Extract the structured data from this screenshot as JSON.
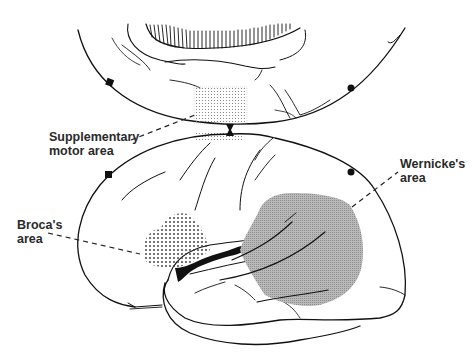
{
  "diagram": {
    "type": "anatomical-illustration",
    "colors": {
      "outline": "#111111",
      "wernicke_fill": "#a6a6a6",
      "broca_stipple": "#333333",
      "sma_stipple": "#777777",
      "background": "#ffffff",
      "label_text": "#2a2a2a"
    },
    "labels": {
      "supplementary_motor_area": "Supplementary\nmotor area",
      "brocas_area": "Broca's\narea",
      "wernickes_area": "Wernicke's\narea"
    },
    "regions": [
      {
        "name": "Supplementary motor area",
        "fill": "fine stipple",
        "location": "upper view, medial surface above central marker"
      },
      {
        "name": "Broca's area",
        "fill": "coarse dot stipple",
        "location": "inferior frontal gyrus, lateral view"
      },
      {
        "name": "Wernicke's area",
        "fill": "gray halftone",
        "location": "posterior superior temporal region, lateral view"
      }
    ],
    "markers": [
      {
        "shape": "square",
        "view": "upper",
        "x": 110,
        "y": 83
      },
      {
        "shape": "circle",
        "view": "upper",
        "x": 351,
        "y": 88
      },
      {
        "shape": "hourglass",
        "view": "junction",
        "x": 230,
        "y": 130
      },
      {
        "shape": "square",
        "view": "lower",
        "x": 108,
        "y": 174
      },
      {
        "shape": "circle",
        "view": "lower",
        "x": 351,
        "y": 172
      }
    ]
  }
}
